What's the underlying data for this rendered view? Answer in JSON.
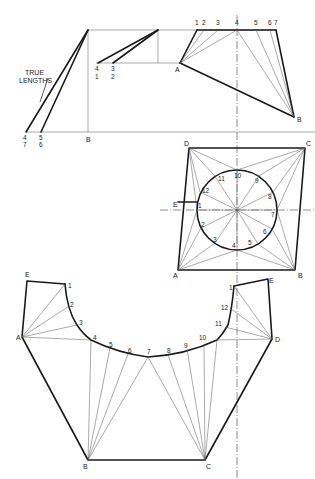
{
  "figure": {
    "annotation": {
      "line1": "TRUE",
      "line2": "LENGTHS"
    }
  },
  "elevation": {
    "top_points": [
      "1",
      "2",
      "3",
      "4",
      "5",
      "6",
      "7"
    ],
    "corner_a": "A",
    "corner_b": "B",
    "tl_pairs": [
      {
        "top": "4",
        "bottom": "1"
      },
      {
        "top": "3",
        "bottom": "2"
      }
    ],
    "tl_base": [
      {
        "top": "4",
        "bottom": "7"
      },
      {
        "top": "5",
        "bottom": "6"
      }
    ],
    "base_label": "B"
  },
  "plan": {
    "corners": {
      "a": "A",
      "b": "B",
      "c": "C",
      "d": "D",
      "e": "E"
    },
    "circle_points": [
      "1",
      "2",
      "3",
      "4",
      "5",
      "6",
      "7",
      "8",
      "9",
      "10",
      "11",
      "12"
    ]
  },
  "development": {
    "corners": {
      "e_left": "E",
      "a": "A",
      "b": "B",
      "c": "C",
      "d": "D",
      "e_right": "E"
    },
    "arc_points": [
      "1",
      "2",
      "3",
      "4",
      "5",
      "6",
      "7",
      "8",
      "9",
      "10",
      "11",
      "12",
      "1"
    ]
  }
}
